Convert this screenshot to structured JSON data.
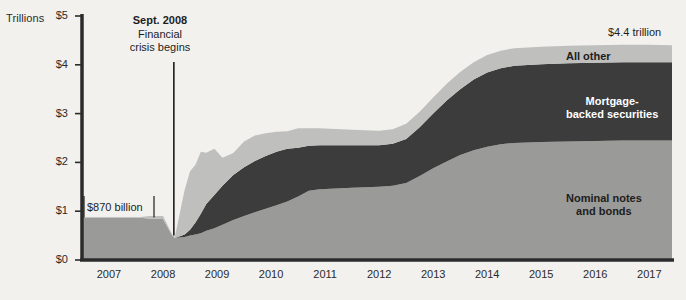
{
  "chart_data": {
    "type": "area",
    "stacked": true,
    "title": "",
    "subtitle": "",
    "xlabel": "",
    "ylabel": "Trillions",
    "ylim": [
      0,
      5
    ],
    "xlim": [
      2007,
      2017.92
    ],
    "grid": false,
    "legend_position": "inline-labels",
    "y_ticks": [
      "$0",
      "$1",
      "$2",
      "$3",
      "$4",
      "$5"
    ],
    "y_tick_values": [
      0,
      1,
      2,
      3,
      4,
      5
    ],
    "x_ticks": [
      "2007",
      "2008",
      "2009",
      "2010",
      "2011",
      "2012",
      "2013",
      "2014",
      "2015",
      "2016",
      "2017"
    ],
    "x_tick_values": [
      2007,
      2008,
      2009,
      2010,
      2011,
      2012,
      2013,
      2014,
      2015,
      2016,
      2017
    ],
    "units": "trillions of US dollars",
    "colors": {
      "background": "#f2f1ee",
      "nominal_notes_and_bonds": "#9a9a99",
      "mortgage_backed_securities": "#3c3c3c",
      "all_other": "#bfbfbd",
      "axis": "#2b2b2b"
    },
    "series": [
      {
        "name": "Nominal notes and bonds",
        "color": "#9a9a99",
        "x": [
          2007.0,
          2007.25,
          2007.5,
          2007.75,
          2008.0,
          2008.25,
          2008.5,
          2008.67,
          2008.72,
          2008.8,
          2008.9,
          2009.0,
          2009.1,
          2009.2,
          2009.3,
          2009.45,
          2009.6,
          2009.8,
          2010.0,
          2010.2,
          2010.4,
          2010.6,
          2010.8,
          2011.0,
          2011.2,
          2011.4,
          2011.6,
          2011.8,
          2012.0,
          2012.25,
          2012.5,
          2012.75,
          2013.0,
          2013.25,
          2013.5,
          2013.75,
          2014.0,
          2014.25,
          2014.5,
          2014.75,
          2015.0,
          2015.5,
          2016.0,
          2016.5,
          2017.0,
          2017.5,
          2017.92
        ],
        "values": [
          0.87,
          0.87,
          0.87,
          0.87,
          0.87,
          0.85,
          0.84,
          0.5,
          0.45,
          0.46,
          0.47,
          0.5,
          0.52,
          0.55,
          0.6,
          0.65,
          0.72,
          0.82,
          0.9,
          0.98,
          1.05,
          1.12,
          1.2,
          1.3,
          1.42,
          1.45,
          1.46,
          1.47,
          1.48,
          1.49,
          1.5,
          1.52,
          1.58,
          1.72,
          1.88,
          2.02,
          2.15,
          2.25,
          2.32,
          2.37,
          2.4,
          2.42,
          2.43,
          2.44,
          2.45,
          2.45,
          2.45
        ]
      },
      {
        "name": "Mortgage-backed securities",
        "color": "#3c3c3c",
        "x": [
          2007.0,
          2007.25,
          2007.5,
          2007.75,
          2008.0,
          2008.25,
          2008.5,
          2008.67,
          2008.72,
          2008.8,
          2008.9,
          2009.0,
          2009.1,
          2009.2,
          2009.3,
          2009.45,
          2009.6,
          2009.8,
          2010.0,
          2010.2,
          2010.4,
          2010.6,
          2010.8,
          2011.0,
          2011.2,
          2011.4,
          2011.6,
          2011.8,
          2012.0,
          2012.25,
          2012.5,
          2012.75,
          2013.0,
          2013.25,
          2013.5,
          2013.75,
          2014.0,
          2014.25,
          2014.5,
          2014.75,
          2015.0,
          2015.5,
          2016.0,
          2016.5,
          2017.0,
          2017.5,
          2017.92
        ],
        "values": [
          0.0,
          0.0,
          0.0,
          0.0,
          0.0,
          0.0,
          0.0,
          0.0,
          0.0,
          0.02,
          0.05,
          0.12,
          0.25,
          0.4,
          0.55,
          0.68,
          0.8,
          0.92,
          1.0,
          1.05,
          1.08,
          1.1,
          1.08,
          1.0,
          0.92,
          0.9,
          0.89,
          0.88,
          0.87,
          0.86,
          0.85,
          0.86,
          0.9,
          1.0,
          1.12,
          1.25,
          1.35,
          1.45,
          1.52,
          1.56,
          1.58,
          1.59,
          1.6,
          1.6,
          1.6,
          1.6,
          1.6
        ]
      },
      {
        "name": "All other",
        "color": "#bfbfbd",
        "x": [
          2007.0,
          2007.25,
          2007.5,
          2007.75,
          2008.0,
          2008.25,
          2008.5,
          2008.67,
          2008.72,
          2008.8,
          2008.9,
          2009.0,
          2009.1,
          2009.2,
          2009.3,
          2009.45,
          2009.6,
          2009.8,
          2010.0,
          2010.2,
          2010.4,
          2010.6,
          2010.8,
          2011.0,
          2011.2,
          2011.4,
          2011.6,
          2011.8,
          2012.0,
          2012.25,
          2012.5,
          2012.75,
          2013.0,
          2013.25,
          2013.5,
          2013.75,
          2014.0,
          2014.25,
          2014.5,
          2014.75,
          2015.0,
          2015.5,
          2016.0,
          2016.5,
          2017.0,
          2017.5,
          2017.92
        ],
        "values": [
          0.0,
          0.0,
          0.0,
          0.0,
          0.0,
          0.05,
          0.06,
          0.02,
          0.03,
          0.35,
          0.9,
          1.3,
          1.15,
          1.2,
          0.95,
          0.85,
          0.62,
          0.5,
          0.45,
          0.43,
          0.4,
          0.38,
          0.36,
          0.4,
          0.36,
          0.35,
          0.34,
          0.33,
          0.32,
          0.31,
          0.3,
          0.3,
          0.31,
          0.32,
          0.33,
          0.34,
          0.35,
          0.35,
          0.36,
          0.36,
          0.36,
          0.36,
          0.36,
          0.36,
          0.36,
          0.36,
          0.35
        ]
      }
    ],
    "annotations": [
      {
        "id": "crisis",
        "headline": "Sept. 2008",
        "line1": "Financial",
        "line2": "crisis begins",
        "x_value": 2008.7
      },
      {
        "id": "start-value",
        "text": "$870 billion",
        "x_value": 2007.0,
        "y_value": 0.87
      },
      {
        "id": "end-value",
        "text": "$4.4 trillion",
        "x_value": 2017.92,
        "y_value": 4.4
      }
    ],
    "series_inline_labels": [
      {
        "id": "all-other",
        "text": "All other"
      },
      {
        "id": "mbs",
        "line1": "Mortgage-",
        "line2": "backed securities"
      },
      {
        "id": "nominal",
        "line1": "Nominal notes",
        "line2": "and bonds"
      }
    ]
  }
}
